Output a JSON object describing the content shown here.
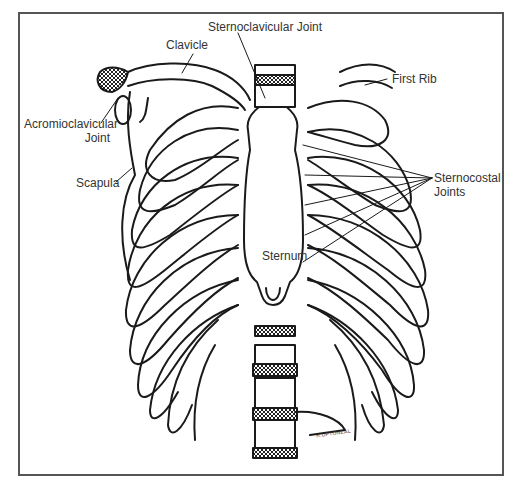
{
  "diagram": {
    "labels": {
      "sternoclavicular_joint": "Sternoclavicular Joint",
      "clavicle": "Clavicle",
      "first_rib": "First Rib",
      "acromioclavicular_joint_line1": "Acromioclavicular",
      "acromioclavicular_joint_line2": "Joint",
      "scapula": "Scapula",
      "sternocostal_joints_line1": "Sternocostal",
      "sternocostal_joints_line2": "Joints",
      "sternum": "Sternum"
    },
    "signature": "R.UPTONEAL",
    "colors": {
      "line": "#1a1a1a",
      "frame": "#555555",
      "text": "#333333",
      "background": "#ffffff"
    }
  }
}
